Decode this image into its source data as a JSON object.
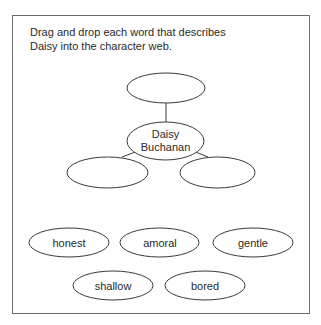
{
  "instructions": {
    "line1": "Drag and drop each word that describes",
    "line2": "Daisy into the character web."
  },
  "web": {
    "center_label_line1": "Daisy",
    "center_label_line2": "Buchanan",
    "drop_slots": [
      {
        "position": "top",
        "value": ""
      },
      {
        "position": "bottom-left",
        "value": ""
      },
      {
        "position": "bottom-right",
        "value": ""
      }
    ]
  },
  "word_bank": [
    {
      "label": "honest"
    },
    {
      "label": "amoral"
    },
    {
      "label": "gentle"
    },
    {
      "label": "shallow"
    },
    {
      "label": "bored"
    }
  ],
  "colors": {
    "border": "#6a6a6a",
    "stroke": "#3a3a3a",
    "text": "#2a2a2a",
    "background": "#ffffff"
  }
}
